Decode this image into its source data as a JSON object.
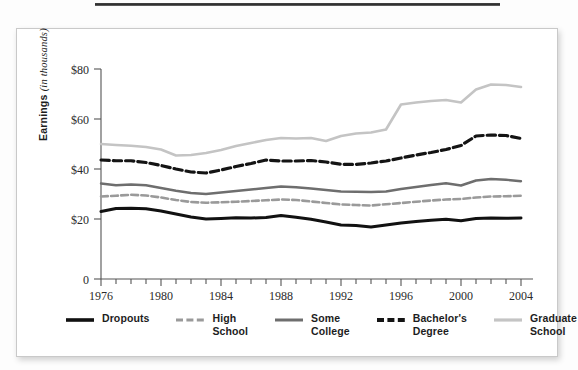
{
  "figure": {
    "panel_title": "",
    "axis": {
      "ylabel_main": "Earnings",
      "ylabel_unit": "(in thousands)",
      "yticks": [
        "$80",
        "$60",
        "$40",
        "$20",
        "0"
      ],
      "xticks": [
        "1976",
        "1980",
        "1984",
        "1988",
        "1992",
        "1996",
        "2000",
        "2004"
      ]
    }
  },
  "legend": {
    "items": [
      {
        "label": "Dropouts",
        "style": "solid",
        "color": "#111111",
        "width": 3.0
      },
      {
        "label": "High\nSchool",
        "style": "dashed",
        "color": "#9a9a9a",
        "width": 2.6
      },
      {
        "label": "Some\nCollege",
        "style": "solid",
        "color": "#6e6e6e",
        "width": 2.4
      },
      {
        "label": "Bachelor's\nDegree",
        "style": "dashed",
        "color": "#141414",
        "width": 3.2
      },
      {
        "label": "Graduate\nSchool",
        "style": "solid",
        "color": "#c4c4c4",
        "width": 2.6
      }
    ]
  },
  "chart_data": {
    "type": "line",
    "title": "",
    "xlabel": "",
    "ylabel": "Earnings (in thousands)",
    "xlim": [
      1976,
      2004
    ],
    "ylim": [
      0,
      80
    ],
    "ytick_values": [
      80,
      60,
      40,
      20,
      0
    ],
    "xtick_values": [
      1976,
      1980,
      1984,
      1988,
      1992,
      1996,
      2000,
      2004
    ],
    "x_minor_tick_every": 1,
    "grid": false,
    "legend_position": "bottom",
    "x": [
      1976,
      1977,
      1978,
      1979,
      1980,
      1981,
      1982,
      1983,
      1984,
      1985,
      1986,
      1987,
      1988,
      1989,
      1990,
      1991,
      1992,
      1993,
      1994,
      1995,
      1996,
      1997,
      1998,
      1999,
      2000,
      2001,
      2002,
      2003,
      2004
    ],
    "series": [
      {
        "name": "Dropouts",
        "color": "#111111",
        "style": "solid",
        "values": [
          23.0,
          24.2,
          24.3,
          24.1,
          23.2,
          22.0,
          20.8,
          20.0,
          20.2,
          20.5,
          20.4,
          20.6,
          21.4,
          20.7,
          19.9,
          19.0,
          18.0,
          17.8,
          17.3,
          18.0,
          18.7,
          19.2,
          19.6,
          19.9,
          19.4,
          20.2,
          20.4,
          20.3,
          20.4
        ]
      },
      {
        "name": "High School",
        "color": "#9a9a9a",
        "style": "dashed",
        "values": [
          29.0,
          29.3,
          29.7,
          29.4,
          28.6,
          27.6,
          26.8,
          26.5,
          26.7,
          26.9,
          27.2,
          27.5,
          27.8,
          27.6,
          27.0,
          26.4,
          25.8,
          25.6,
          25.4,
          25.9,
          26.4,
          26.9,
          27.4,
          27.8,
          28.0,
          28.6,
          29.0,
          29.1,
          29.3
        ]
      },
      {
        "name": "Some College",
        "color": "#6e6e6e",
        "style": "solid",
        "values": [
          34.2,
          33.5,
          33.8,
          33.5,
          32.4,
          31.3,
          30.4,
          30.0,
          30.6,
          31.2,
          31.8,
          32.4,
          33.0,
          32.7,
          32.2,
          31.6,
          31.0,
          30.9,
          30.8,
          31.0,
          32.0,
          32.8,
          33.6,
          34.3,
          33.4,
          35.4,
          36.0,
          35.7,
          35.1
        ]
      },
      {
        "name": "Bachelor's Degree",
        "color": "#141414",
        "style": "dashed",
        "values": [
          43.6,
          43.3,
          43.3,
          42.6,
          41.4,
          40.0,
          38.8,
          38.4,
          39.6,
          41.0,
          42.2,
          43.6,
          43.2,
          43.2,
          43.4,
          42.8,
          41.9,
          41.8,
          42.4,
          43.2,
          44.4,
          45.6,
          46.6,
          47.8,
          49.4,
          53.2,
          53.6,
          53.4,
          52.2
        ]
      },
      {
        "name": "Graduate School",
        "color": "#c4c4c4",
        "style": "solid",
        "values": [
          50.0,
          49.6,
          49.3,
          48.8,
          47.8,
          45.4,
          45.6,
          46.4,
          47.6,
          49.2,
          50.4,
          51.6,
          52.4,
          52.2,
          52.4,
          51.2,
          53.2,
          54.2,
          54.6,
          55.8,
          65.8,
          66.6,
          67.2,
          67.6,
          66.6,
          71.8,
          73.8,
          73.6,
          72.8
        ]
      }
    ]
  }
}
